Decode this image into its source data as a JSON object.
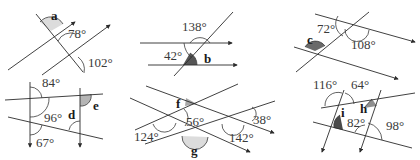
{
  "colors": {
    "line": "#2b2b2b",
    "shade_light": "#d9d9d9",
    "shade_mid": "#9a9a9a",
    "shade_dark": "#5a5a5a"
  },
  "diagrams": [
    {
      "id": "diagram-1",
      "unknown": "a",
      "given_angles": [
        "78°",
        "102°"
      ]
    },
    {
      "id": "diagram-2",
      "unknown": "b",
      "given_angles": [
        "138°",
        "42°"
      ]
    },
    {
      "id": "diagram-3",
      "unknown": "c",
      "given_angles": [
        "72°",
        "108°"
      ]
    },
    {
      "id": "diagram-4",
      "unknowns": [
        "d",
        "e"
      ],
      "given_angles": [
        "84°",
        "96°",
        "67°"
      ]
    },
    {
      "id": "diagram-5",
      "unknowns": [
        "f",
        "g"
      ],
      "given_angles": [
        "56°",
        "124°",
        "142°",
        "38°"
      ]
    },
    {
      "id": "diagram-6",
      "unknowns": [
        "h",
        "i"
      ],
      "given_angles": [
        "116°",
        "64°",
        "82°",
        "98°"
      ]
    }
  ]
}
